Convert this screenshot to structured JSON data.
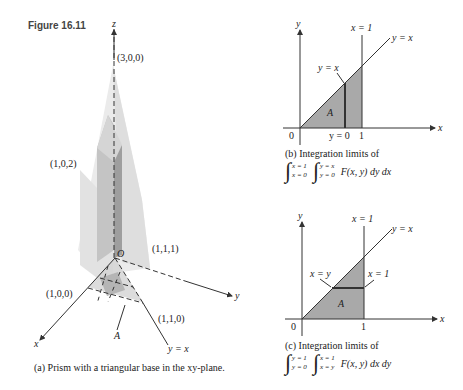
{
  "figure": {
    "title": "Figure 16.11"
  },
  "panel_a": {
    "axis_labels": {
      "x": "x",
      "y": "y",
      "z": "z",
      "origin": "O"
    },
    "points": {
      "p300": "(3,0,0)",
      "p102": "(1,0,2)",
      "p111": "(1,1,1)",
      "p100": "(1,0,0)",
      "p110": "(1,1,0)"
    },
    "region_label": "A",
    "line_label": "y = x",
    "caption": "(a) Prism with a triangular base in the xy-plane."
  },
  "panel_b": {
    "axis_labels": {
      "x": "x",
      "y": "y"
    },
    "origin": "0",
    "tick_one": "1",
    "labels": {
      "x_eq_1": "x = 1",
      "y_eq_x_line": "y = x",
      "y_eq_x_pointer": "y = x",
      "y_eq_0": "y = 0",
      "region": "A"
    },
    "caption": "(b) Integration limits of",
    "integral": {
      "outer_upper": "x = 1",
      "outer_lower": "x = 0",
      "inner_upper": "y = x",
      "inner_lower": "y = 0",
      "integrand": "F(x, y) dy dx"
    }
  },
  "panel_c": {
    "axis_labels": {
      "x": "x",
      "y": "y"
    },
    "origin": "0",
    "tick_one": "1",
    "labels": {
      "x_eq_1_top": "x = 1",
      "y_eq_x_line": "y = x",
      "x_eq_y_pointer": "x = y",
      "x_eq_1_pointer": "x = 1",
      "region": "A"
    },
    "caption": "(c) Integration limits of",
    "integral": {
      "outer_upper": "y = 1",
      "outer_lower": "y = 0",
      "inner_upper": "x = 1",
      "inner_lower": "x = y",
      "integrand": "F(x, y) dx dy"
    }
  },
  "colors": {
    "region_fill": "#a9a9a9",
    "prism_light": "#e6e6e6",
    "prism_mid": "#cfcfcf",
    "prism_dark": "#9a9a9a",
    "line": "#333333"
  }
}
